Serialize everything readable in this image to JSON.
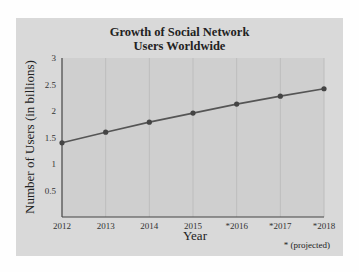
{
  "chart_data": {
    "type": "line",
    "title": "Growth of Social Network Users Worldwide",
    "title_lines": [
      "Growth of Social Network",
      "Users Worldwide"
    ],
    "xlabel": "Year",
    "ylabel": "Number of Users (in billions)",
    "categories": [
      "2012",
      "2013",
      "2014",
      "2015",
      "*2016",
      "*2017",
      "*2018"
    ],
    "series": [
      {
        "name": "Social Network Users",
        "values": [
          1.4,
          1.6,
          1.79,
          1.96,
          2.13,
          2.28,
          2.42
        ]
      }
    ],
    "yticks": [
      "0.5",
      "1",
      "1.5",
      "2",
      "2.5",
      "3"
    ],
    "ytick_values": [
      0.5,
      1,
      1.5,
      2,
      2.5,
      3
    ],
    "ylim": [
      0,
      3
    ],
    "grid": "vertical",
    "annotation": "* (projected)",
    "colors": {
      "panel": "#d9d9d9",
      "plot": "#cfcfcf",
      "line": "#555555",
      "grid": "#bdbdbd"
    }
  }
}
